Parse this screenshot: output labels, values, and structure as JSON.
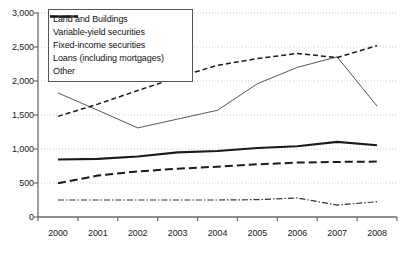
{
  "chart_data": {
    "type": "line",
    "title": "",
    "xlabel": "",
    "ylabel": "",
    "categories": [
      "2000",
      "2001",
      "2002",
      "2003",
      "2004",
      "2005",
      "2006",
      "2007",
      "2008"
    ],
    "x": [
      2000,
      2001,
      2002,
      2003,
      2004,
      2005,
      2006,
      2007,
      2008
    ],
    "ylim": [
      0,
      3000
    ],
    "yticks": [
      0,
      500,
      1000,
      1500,
      2000,
      2500,
      3000
    ],
    "ytick_labels": [
      "0",
      "500",
      "1,000",
      "1,500",
      "2,000",
      "2,500",
      "3,000"
    ],
    "grid": "horizontal-dotted",
    "legend_position": "top-left-inside",
    "series": [
      {
        "name": "Land and Buildings",
        "style": "solid-thick",
        "color": "#1a1a1a",
        "values": [
          845,
          855,
          890,
          950,
          970,
          1015,
          1040,
          1105,
          1055
        ]
      },
      {
        "name": "Variable-yield securities",
        "style": "solid-thin",
        "color": "#444444",
        "values": [
          1825,
          1570,
          1310,
          1440,
          1570,
          1960,
          2200,
          2355,
          1630
        ]
      },
      {
        "name": "Fixed-income securities",
        "style": "dashed",
        "color": "#1a1a1a",
        "values": [
          1480,
          1660,
          1860,
          2055,
          2230,
          2330,
          2405,
          2345,
          2520
        ]
      },
      {
        "name": "Loans (including mortgages)",
        "style": "dash-dot",
        "color": "#333333",
        "values": [
          250,
          250,
          250,
          250,
          250,
          255,
          280,
          175,
          225
        ]
      },
      {
        "name": "Other",
        "style": "long-dash",
        "color": "#1a1a1a",
        "values": [
          495,
          610,
          670,
          710,
          740,
          775,
          800,
          810,
          815
        ]
      }
    ]
  },
  "legend": {
    "entries": [
      {
        "label": "Land and Buildings"
      },
      {
        "label": "Variable-yield securities"
      },
      {
        "label": "Fixed-income securities"
      },
      {
        "label": "Loans (including mortgages)"
      },
      {
        "label": "Other"
      }
    ]
  },
  "colors": {
    "axis": "#6b6b6b",
    "grid": "#c8c8c8",
    "text": "#1a1a1a",
    "legend_border": "#555555"
  }
}
